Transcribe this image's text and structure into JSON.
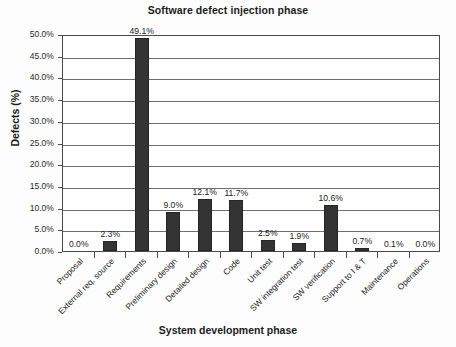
{
  "chart_data": {
    "type": "bar",
    "title": "Software defect injection phase",
    "xlabel": "System development phase",
    "ylabel": "Defects (%)",
    "ylim": [
      0,
      50
    ],
    "ytick_step": 5,
    "grid": true,
    "legend": null,
    "bar_color": "#343434",
    "categories": [
      "Proposal",
      "External req. source",
      "Requirements",
      "Preliminary design",
      "Detailed design",
      "Code",
      "Unit test",
      "SW integration test",
      "SW verification",
      "Support to I & T",
      "Maintenance",
      "Operations"
    ],
    "values": [
      0.0,
      2.3,
      49.1,
      9.0,
      12.1,
      11.7,
      2.5,
      1.9,
      10.6,
      0.7,
      0.1,
      0.0
    ],
    "data_labels": [
      "0.0%",
      "2.3%",
      "49.1%",
      "9.0%",
      "12.1%",
      "11.7%",
      "2.5%",
      "1.9%",
      "10.6%",
      "0.7%",
      "0.1%",
      "0.0%"
    ],
    "ytick_labels": [
      "0.0%",
      "5.0%",
      "10.0%",
      "15.0%",
      "20.0%",
      "25.0%",
      "30.0%",
      "35.0%",
      "40.0%",
      "45.0%",
      "50.0%"
    ]
  }
}
